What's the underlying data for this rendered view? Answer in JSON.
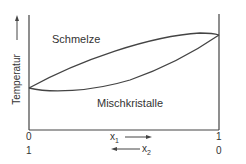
{
  "diagram": {
    "type": "binary-phase-diagram",
    "regions": {
      "upper": "Schmelze",
      "lower": "Mischkristalle"
    },
    "y_axis": {
      "label": "Temperatur",
      "arrow": "up"
    },
    "x_axis": {
      "x1_label": "x",
      "x1_sub": "1",
      "x2_label": "x",
      "x2_sub": "2",
      "x1_arrow": "right",
      "x2_arrow": "left",
      "left_ticks": {
        "x1": "0",
        "x2": "1"
      },
      "right_ticks": {
        "x1": "1",
        "x2": "0"
      }
    },
    "line_color": "#444444"
  }
}
